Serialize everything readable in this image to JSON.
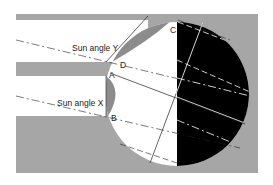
{
  "diagram": {
    "labels": {
      "sun_angle_y": "Sun angle Y",
      "sun_angle_x": "Sun angle X"
    },
    "points": {
      "a": "A",
      "b": "B",
      "c": "C",
      "d": "D"
    },
    "colors": {
      "background": "#ffffff",
      "gray": "#a6a6a6",
      "shadow": "#8c8c8c",
      "dark": "#000000",
      "light": "#ffffff",
      "line": "#222222"
    }
  }
}
